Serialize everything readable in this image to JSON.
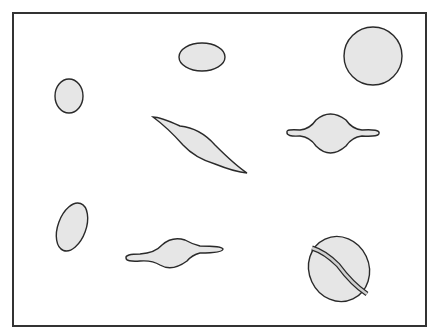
{
  "figure": {
    "colors": {
      "outline": "#2a2a2a",
      "fill": "#e6e6e6",
      "frame": "#333333",
      "background": "#ffffff"
    },
    "cells": [
      {
        "id": "oval-small-top",
        "shape": "ellipse"
      },
      {
        "id": "round-top-right",
        "shape": "circle"
      },
      {
        "id": "oval-left",
        "shape": "ellipse"
      },
      {
        "id": "sickle-diagonal",
        "shape": "sickle"
      },
      {
        "id": "spindle-right",
        "shape": "spindle"
      },
      {
        "id": "oval-tilted-bottom-left",
        "shape": "ellipse"
      },
      {
        "id": "spindle-bottom",
        "shape": "spindle"
      },
      {
        "id": "oval-with-band",
        "shape": "ellipse-banded"
      }
    ]
  }
}
